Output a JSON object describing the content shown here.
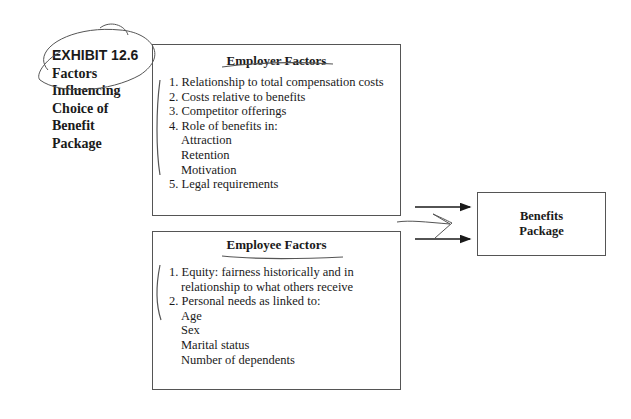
{
  "exhibit": {
    "label": "EXHIBIT 12.6",
    "title_lines": [
      "Factors",
      "Influencing",
      "Choice of",
      "Benefit",
      "Package"
    ]
  },
  "employer_factors": {
    "heading": "Employer Factors",
    "items": [
      "1. Relationship to total compensation costs",
      "2. Costs relative to benefits",
      "3. Competitor offerings",
      "4. Role of benefits in:"
    ],
    "sub_items": [
      "Attraction",
      "Retention",
      "Motivation"
    ],
    "last_item": "5. Legal requirements"
  },
  "employee_factors": {
    "heading": "Employee Factors",
    "items": [
      "1. Equity: fairness historically and in",
      "relationship to what others receive",
      "2. Personal needs as linked to:"
    ],
    "sub_items": [
      "Age",
      "Sex",
      "Marital status",
      "Number of dependents"
    ]
  },
  "output": {
    "lines": [
      "Benefits",
      "Package"
    ]
  },
  "annotations": {
    "ink_color": "#555555",
    "note": "handwritten pen marks: circle around exhibit label, underlines under headings, brackets beside lists, scribble between arrows"
  }
}
